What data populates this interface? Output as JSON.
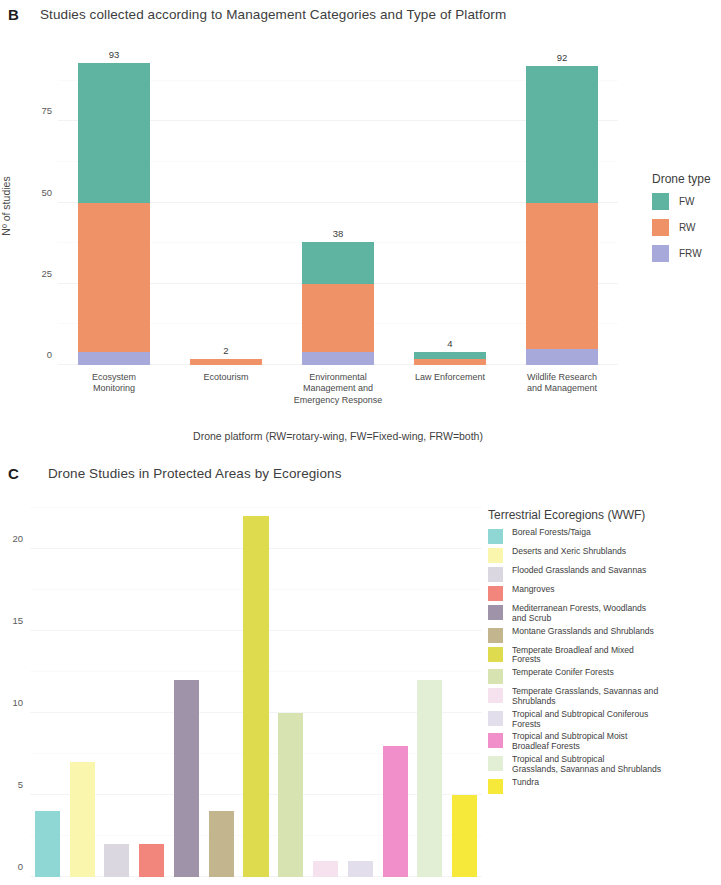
{
  "panel_b": {
    "letter": "B",
    "title": "Studies collected according to Management Categories and Type of Platform",
    "legend_title": "Drone type"
  },
  "panel_c": {
    "letter": "C",
    "title": "Drone Studies in Protected Areas by Ecoregions",
    "legend_title": "Terrestrial Ecoregions (WWF)"
  },
  "chart_data": [
    {
      "type": "bar",
      "id": "panel-b",
      "stacked": true,
      "title": "Studies collected according to Management Categories and Type of Platform",
      "xlabel": "Drone platform (RW=rotary-wing, FW=Fixed-wing, FRW=both)",
      "ylabel": "Nº of studies",
      "ylim": [
        0,
        100
      ],
      "yticks": [
        0,
        25,
        50,
        75
      ],
      "ytick_labels": [
        "0",
        "25",
        "50",
        "75"
      ],
      "grid": true,
      "legend_position": "right",
      "legend_title": "Drone type",
      "categories": [
        "Ecosystem\nMonitoring",
        "Ecotourism",
        "Environmental\nManagement and\nEmergency Response",
        "Law Enforcement",
        "Wildlife Research\nand Management"
      ],
      "category_lines": [
        [
          "Ecosystem",
          "Monitoring"
        ],
        [
          "Ecotourism"
        ],
        [
          "Environmental",
          "Management and",
          "Emergency Response"
        ],
        [
          "Law Enforcement"
        ],
        [
          "Wildlife Research",
          "and Management"
        ]
      ],
      "series": [
        {
          "name": "FW",
          "color": "#5eb4a0",
          "values": [
            43,
            0,
            13,
            2,
            42
          ]
        },
        {
          "name": "RW",
          "color": "#f09268",
          "values": [
            46,
            2,
            21,
            2,
            45
          ]
        },
        {
          "name": "FRW",
          "color": "#a6a9d9",
          "values": [
            4,
            0,
            4,
            0,
            5
          ]
        }
      ],
      "totals": [
        93,
        2,
        38,
        4,
        92
      ],
      "total_labels": [
        "93",
        "2",
        "38",
        "4",
        "92"
      ]
    },
    {
      "type": "bar",
      "id": "panel-c",
      "stacked": false,
      "title": "Drone Studies in Protected Areas by Ecoregions",
      "xlabel": "",
      "ylabel": "",
      "ylim": [
        0,
        22.8
      ],
      "yticks": [
        0,
        5,
        10,
        15,
        20
      ],
      "ytick_labels": [
        "0",
        "5",
        "10",
        "15",
        "20"
      ],
      "grid": true,
      "legend_position": "right",
      "legend_title": "Terrestrial Ecoregions (WWF)",
      "categories": [
        "Boreal Forests/Taiga",
        "Deserts and Xeric Shrublands",
        "Flooded Grasslands and Savannas",
        "Mangroves",
        "Mediterranean Forests, Woodlands and Scrub",
        "Montane Grasslands and Shrublands",
        "Temperate Broadleaf and Mixed Forests",
        "Temperate Conifer Forests",
        "Temperate Grasslands, Savannas and Shrublands",
        "Tropical and Subtropical Coniferous Forests",
        "Tropical and Subtropical Moist Broadleaf Forests",
        "Tropical and Subtropical Grasslands, Savannas and Shrublands",
        "Tundra"
      ],
      "legend_entries": [
        {
          "lines": [
            "Boreal Forests/Taiga"
          ],
          "color": "#8fd7d5"
        },
        {
          "lines": [
            "Deserts and Xeric Shrublands"
          ],
          "color": "#fbf6ae"
        },
        {
          "lines": [
            "Flooded Grasslands and Savannas"
          ],
          "color": "#dad7e1"
        },
        {
          "lines": [
            "Mangroves"
          ],
          "color": "#f2867c"
        },
        {
          "lines": [
            "Mediterranean Forests, Woodlands",
            "and Scrub"
          ],
          "color": "#9f93a9"
        },
        {
          "lines": [
            "Montane Grasslands and Shrublands"
          ],
          "color": "#c3b58d"
        },
        {
          "lines": [
            "Temperate Broadleaf and Mixed",
            "Forests"
          ],
          "color": "#dedb4f"
        },
        {
          "lines": [
            "Temperate Conifer Forests"
          ],
          "color": "#d7e4b1"
        },
        {
          "lines": [
            "Temperate Grasslands, Savannas and",
            "Shrublands"
          ],
          "color": "#f6e1ef"
        },
        {
          "lines": [
            "Tropical and Subtropical Coniferous",
            "Forests"
          ],
          "color": "#e3deeb"
        },
        {
          "lines": [
            "Tropical and Subtropical Moist",
            "Broadleaf Forests"
          ],
          "color": "#f08fca"
        },
        {
          "lines": [
            "Tropical and Subtropical",
            "Grasslands, Savannas and Shrublands"
          ],
          "color": "#e3efd5"
        },
        {
          "lines": [
            "Tundra"
          ],
          "color": "#f6e939"
        }
      ],
      "values": [
        4,
        7,
        2,
        2,
        12,
        4,
        22,
        10,
        1,
        1,
        8,
        12,
        5
      ],
      "colors": [
        "#8fd7d5",
        "#fbf6ae",
        "#dad7e1",
        "#f2867c",
        "#9f93a9",
        "#c3b58d",
        "#dedb4f",
        "#d7e4b1",
        "#f6e1ef",
        "#e3deeb",
        "#f08fca",
        "#e3efd5",
        "#f6e939"
      ]
    }
  ]
}
